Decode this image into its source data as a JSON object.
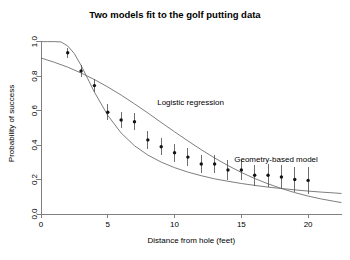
{
  "chart_data": {
    "type": "line",
    "title": "Two models fit to the golf putting data",
    "xlabel": "Distance from hole (feet)",
    "ylabel": "Probability of success",
    "xlim": [
      0,
      22.5
    ],
    "ylim": [
      0,
      1.05
    ],
    "xticks": [
      0,
      5,
      10,
      15,
      20
    ],
    "xticklabels": [
      "0",
      "5",
      "10",
      "15",
      "20"
    ],
    "yticks": [
      0.0,
      0.2,
      0.4,
      0.6,
      0.8,
      1.0
    ],
    "yticklabels": [
      "0.0",
      "0.2",
      "0.4",
      "0.6",
      "0.8",
      "1.0"
    ],
    "grid": false,
    "legend": "none",
    "annotations": [
      {
        "text": "Logistic regression",
        "x": 11.2,
        "y": 0.63
      },
      {
        "text": "Geometry-based model",
        "x": 17.6,
        "y": 0.3
      }
    ],
    "points": {
      "name": "Observed success rate",
      "x": [
        2,
        3,
        4,
        5,
        6,
        7,
        8,
        9,
        10,
        11,
        12,
        13,
        14,
        15,
        16,
        17,
        18,
        19,
        20
      ],
      "y": [
        0.935,
        0.83,
        0.745,
        0.59,
        0.545,
        0.535,
        0.43,
        0.39,
        0.355,
        0.33,
        0.29,
        0.29,
        0.255,
        0.255,
        0.225,
        0.225,
        0.215,
        0.2,
        0.195
      ],
      "yerr": [
        0.013,
        0.016,
        0.018,
        0.021,
        0.022,
        0.023,
        0.023,
        0.023,
        0.023,
        0.024,
        0.024,
        0.025,
        0.026,
        0.027,
        0.028,
        0.03,
        0.031,
        0.033,
        0.035
      ]
    },
    "series": [
      {
        "name": "Logistic regression",
        "x": [
          0,
          1,
          2,
          3,
          4,
          5,
          6,
          7,
          8,
          9,
          10,
          11,
          12,
          13,
          14,
          15,
          16,
          17,
          18,
          19,
          20,
          21,
          22,
          22.5
        ],
        "y": [
          0.905,
          0.88,
          0.852,
          0.818,
          0.78,
          0.737,
          0.69,
          0.639,
          0.586,
          0.531,
          0.477,
          0.424,
          0.373,
          0.325,
          0.281,
          0.241,
          0.206,
          0.175,
          0.148,
          0.124,
          0.104,
          0.087,
          0.073,
          0.066
        ]
      },
      {
        "name": "Geometry-based model",
        "x": [
          0,
          0.5,
          1,
          1.5,
          2,
          2.5,
          3,
          3.5,
          4,
          5,
          6,
          7,
          8,
          9,
          10,
          11,
          12,
          13,
          14,
          15,
          16,
          17,
          18,
          19,
          20,
          21,
          22,
          22.5
        ],
        "y": [
          1.0,
          1.0,
          1.0,
          0.998,
          0.975,
          0.93,
          0.862,
          0.785,
          0.707,
          0.572,
          0.47,
          0.396,
          0.342,
          0.301,
          0.269,
          0.243,
          0.222,
          0.204,
          0.19,
          0.177,
          0.166,
          0.156,
          0.148,
          0.14,
          0.133,
          0.127,
          0.122,
          0.119
        ]
      }
    ]
  },
  "colors": {
    "curve": "#6f6f6f",
    "axis": "#808080",
    "point": "#111111",
    "text": "#000000",
    "background": "#ffffff"
  }
}
